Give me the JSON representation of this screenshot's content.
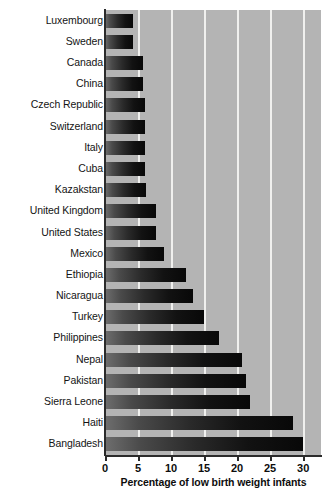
{
  "chart_data": {
    "type": "bar",
    "orientation": "horizontal",
    "title": "",
    "xlabel": "Percentage of low birth weight infants",
    "ylabel": "",
    "xlim": [
      0,
      32.7
    ],
    "xticks": [
      0,
      5,
      10,
      15,
      20,
      25,
      30
    ],
    "xtick_labels": [
      "0",
      "5",
      "10",
      "15",
      "20",
      "25",
      "30"
    ],
    "grid": "vertical-white-gridlines",
    "legend": "none",
    "categories": [
      "Luxembourg",
      "Sweden",
      "Canada",
      "China",
      "Czech Republic",
      "Switzerland",
      "Italy",
      "Cuba",
      "Kazakstan",
      "United Kingdom",
      "United States",
      "Mexico",
      "Ethiopia",
      "Nicaragua",
      "Turkey",
      "Philippines",
      "Nepal",
      "Pakistan",
      "Sierra Leone",
      "Haiti",
      "Bangladesh"
    ],
    "values": [
      4.2,
      4.2,
      5.8,
      5.8,
      6.0,
      6.0,
      6.0,
      6.1,
      6.2,
      7.7,
      7.7,
      9.0,
      12.3,
      13.3,
      15.0,
      17.3,
      20.7,
      21.4,
      21.9,
      28.5,
      30.0
    ],
    "colors": {
      "plot_background": "#b4b4b4",
      "gridline": "#f0f0ee",
      "bar_gradient_start": "#6e6e6e",
      "bar_gradient_end": "#080808",
      "axis": "#2b2b2b",
      "text": "#0d0d0d",
      "page_background": "#ffffff"
    }
  }
}
